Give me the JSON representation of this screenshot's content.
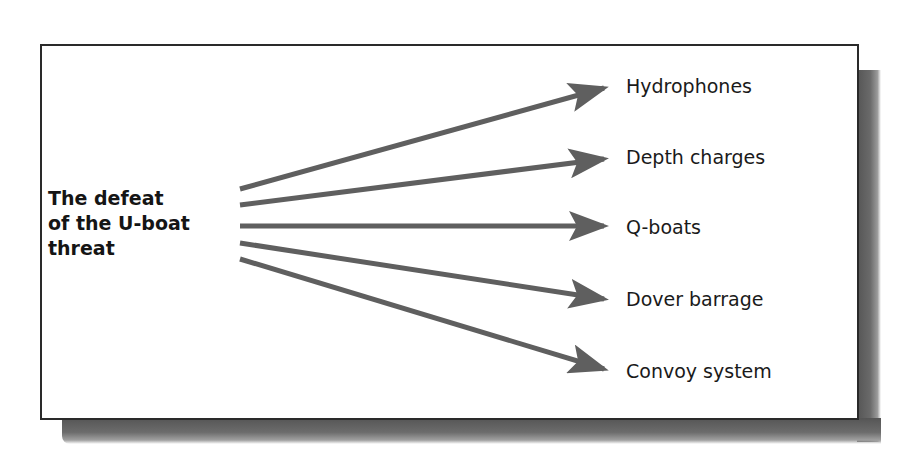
{
  "diagram": {
    "type": "one-to-many arrow diagram",
    "central_topic": {
      "lines": [
        "The defeat",
        "of the U-boat",
        "threat"
      ],
      "full_text": "The defeat of the U-boat threat"
    },
    "branches": [
      {
        "label": "Hydrophones"
      },
      {
        "label": "Depth charges"
      },
      {
        "label": "Q-boats"
      },
      {
        "label": "Dover barrage"
      },
      {
        "label": "Convoy system"
      }
    ],
    "colors": {
      "arrow": "#5f5f5f",
      "border": "#2a2a2a",
      "text": "#1a1a1a",
      "shadow": "#555555",
      "background": "#ffffff"
    }
  }
}
